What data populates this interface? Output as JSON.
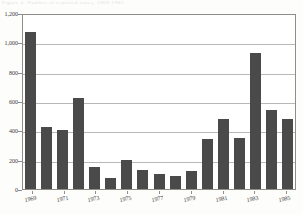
{
  "figure": {
    "caption_remnant": "Figure 4.  Number of reported cases, 1969-1985"
  },
  "chart_data": {
    "type": "bar",
    "title": "",
    "xlabel": "",
    "ylabel": "",
    "categories": [
      "1969",
      "1970",
      "1971",
      "1972",
      "1973",
      "1974",
      "1975",
      "1976",
      "1977",
      "1978",
      "1979",
      "1980",
      "1981",
      "1982",
      "1983",
      "1984",
      "1985"
    ],
    "values": [
      1070,
      420,
      405,
      620,
      150,
      75,
      200,
      130,
      100,
      90,
      120,
      340,
      480,
      350,
      930,
      540,
      480
    ],
    "ylim": [
      0,
      1200
    ],
    "ytick_values": [
      0,
      200,
      400,
      600,
      800,
      1000,
      1200
    ],
    "ytick_labels": [
      "0",
      "200",
      "400",
      "600",
      "800",
      "1,000",
      "1,200"
    ],
    "xtick_labels": [
      "1969",
      "1971",
      "1973",
      "1975",
      "1977",
      "1979",
      "1981",
      "1983",
      "1985"
    ],
    "xtick_indices": [
      0,
      2,
      4,
      6,
      8,
      10,
      12,
      14,
      16
    ],
    "grid": true,
    "legend": null,
    "bar_color": "#4a4a4a",
    "axis_color": "#8e8d8a",
    "grid_color": "#b9b8b4",
    "background_color": "#ffffff"
  }
}
